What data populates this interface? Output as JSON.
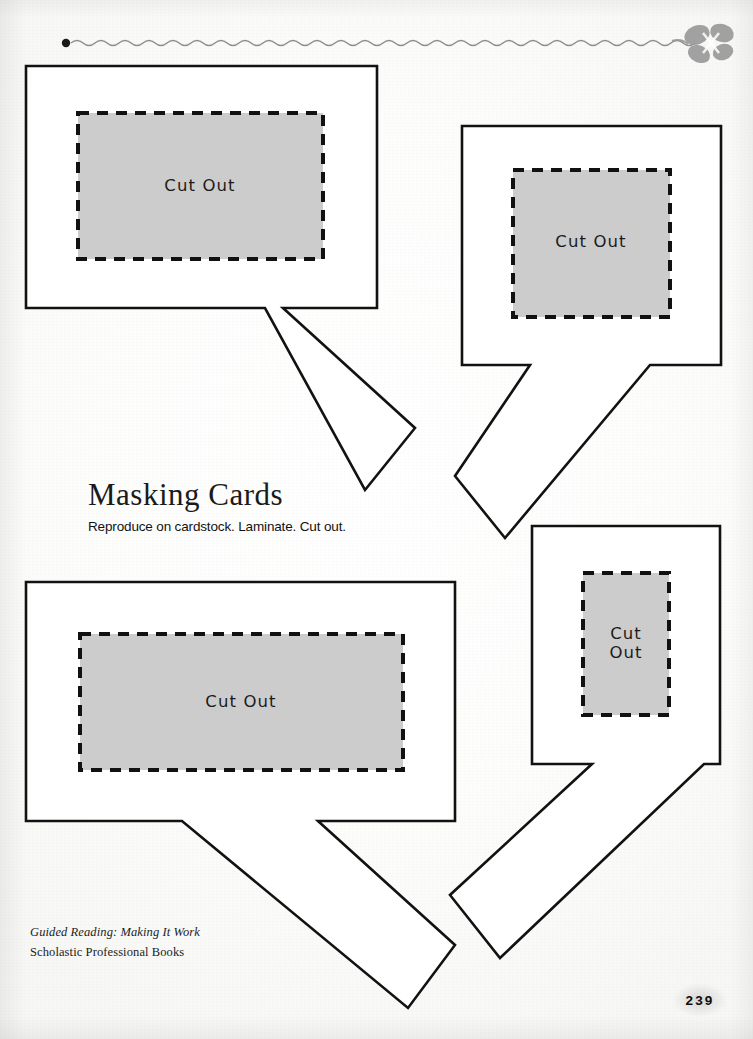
{
  "page": {
    "title": "Masking Cards",
    "subtitle": "Reproduce on cardstock. Laminate. Cut out.",
    "page_number": "239",
    "background_color": "#fdfdfc",
    "ink_color": "#111111",
    "window_fill_color": "#cccccc"
  },
  "header_ornament": {
    "name": "wavy-rule-with-bow",
    "dot_label": "",
    "bow_color": "#9a9a9a"
  },
  "footer": {
    "line1": "Guided Reading: Making It Work",
    "line2": "Scholastic Professional Books"
  },
  "cards": [
    {
      "id": "card-top-left",
      "label": "Cut Out",
      "tail_direction": "down-right",
      "body": {
        "x": 26,
        "y": 66,
        "width": 351,
        "height": 242
      },
      "window": {
        "x": 78,
        "y": 113,
        "width": 245,
        "height": 146
      },
      "label_x": 200,
      "label_y": 186
    },
    {
      "id": "card-top-right",
      "label": "Cut Out",
      "tail_direction": "down-left",
      "body": {
        "x": 462,
        "y": 126,
        "width": 259,
        "height": 239
      },
      "window": {
        "x": 513,
        "y": 170,
        "width": 157,
        "height": 147
      },
      "label_x": 591,
      "label_y": 242
    },
    {
      "id": "card-bottom-left",
      "label": "Cut Out",
      "tail_direction": "down-right",
      "body": {
        "x": 26,
        "y": 582,
        "width": 429,
        "height": 239
      },
      "window": {
        "x": 80,
        "y": 634,
        "width": 323,
        "height": 136
      },
      "label_x": 241,
      "label_y": 702
    },
    {
      "id": "card-bottom-right",
      "label": "Cut\nOut",
      "tail_direction": "down-left",
      "body": {
        "x": 532,
        "y": 526,
        "width": 188,
        "height": 238
      },
      "window": {
        "x": 583,
        "y": 573,
        "width": 86,
        "height": 142
      },
      "label_x": 626,
      "label_y": 644
    }
  ]
}
